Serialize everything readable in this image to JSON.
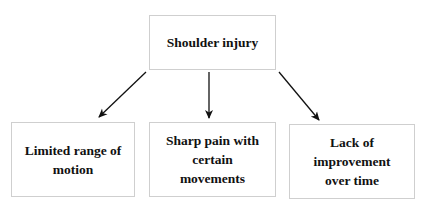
{
  "diagram": {
    "type": "tree",
    "root": {
      "id": "root",
      "label": "Shoulder injury"
    },
    "children": [
      {
        "id": "a",
        "label": "Limited range of motion"
      },
      {
        "id": "b",
        "label": "Sharp pain with certain movements"
      },
      {
        "id": "c",
        "label": "Lack of improvement over time"
      }
    ],
    "edges": [
      {
        "from": "root",
        "to": "a"
      },
      {
        "from": "root",
        "to": "b"
      },
      {
        "from": "root",
        "to": "c"
      }
    ],
    "colors": {
      "box_border": "#cfcfcf",
      "text": "#111111",
      "arrow": "#111111",
      "background": "#ffffff"
    }
  }
}
